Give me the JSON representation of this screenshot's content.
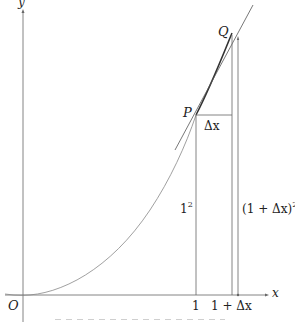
{
  "diagram": {
    "type": "derivative-of-x-squared-illustration",
    "axes": {
      "x_label": "x",
      "y_label": "y",
      "origin_label": "O"
    },
    "points": [
      {
        "name": "P",
        "label": "P"
      },
      {
        "name": "Q",
        "label": "Q"
      }
    ],
    "tick_labels": {
      "x_one": "1",
      "x_one_plus_dx": "1 + Δx"
    },
    "annotations": {
      "delta_x": "Δx",
      "one_squared_base": "1",
      "one_squared_exp": "2",
      "one_plus_dx_squared_base": "(1 + Δx)",
      "one_plus_dx_squared_exp": "2"
    },
    "colors": {
      "line": "#555555",
      "curve": "#777777",
      "tangent": "#444444",
      "text": "#222222"
    }
  }
}
